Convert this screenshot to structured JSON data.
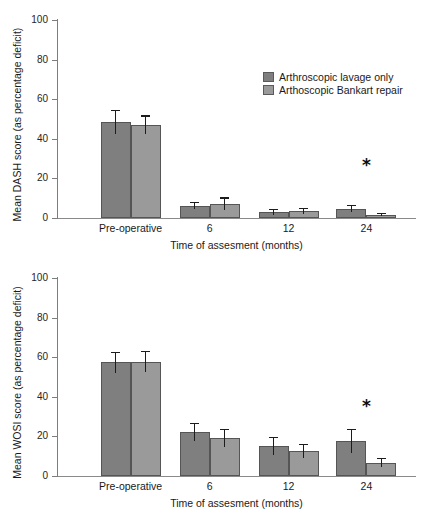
{
  "figure": {
    "panels": [
      "dash",
      "wosi"
    ]
  },
  "legend": {
    "position": "top-right-of-upper-panel",
    "entries": [
      {
        "label": "Arthroscopic lavage only",
        "color": "#7f7f7f",
        "key": "lavage"
      },
      {
        "label": "Arthoscopic Bankart repair",
        "color": "#9a9a9a",
        "key": "bankart"
      }
    ]
  },
  "colors": {
    "series_dark": "#7f7f7f",
    "series_light": "#9a9a9a",
    "axis": "#7d7d7d",
    "error_bar": "#1c1c1c",
    "text": "#1a1a1a"
  },
  "chart_data": [
    {
      "id": "dash",
      "type": "bar",
      "title": "",
      "xlabel": "Time of assesment (months)",
      "ylabel": "Mean DASH score (as percentage deficit)",
      "ylim": [
        0,
        100
      ],
      "yticks": [
        0,
        20,
        40,
        60,
        80,
        100
      ],
      "ytick_labels": [
        "0",
        "20",
        "40",
        "60",
        "80",
        "100"
      ],
      "grid": false,
      "legend_position": "upper right",
      "categories": [
        "Pre-operative",
        "6",
        "12",
        "24"
      ],
      "series": [
        {
          "name": "Arthroscopic lavage only",
          "color": "#7f7f7f",
          "values": [
            48.5,
            6.2,
            3.0,
            4.8
          ],
          "errors": [
            6.0,
            1.8,
            1.5,
            1.8
          ]
        },
        {
          "name": "Arthoscopic Bankart repair",
          "color": "#9a9a9a",
          "values": [
            47.0,
            7.2,
            3.6,
            1.7
          ],
          "errors": [
            4.8,
            3.2,
            1.6,
            0.7
          ]
        }
      ],
      "annotations": [
        {
          "text": "*",
          "category": "24",
          "y": 22,
          "meaning": "significant-difference"
        }
      ]
    },
    {
      "id": "wosi",
      "type": "bar",
      "title": "",
      "xlabel": "Time of assesment (months)",
      "ylabel": "Mean WOSI score (as percentage deficit)",
      "ylim": [
        0,
        100
      ],
      "yticks": [
        0,
        20,
        40,
        60,
        80,
        100
      ],
      "ytick_labels": [
        "0",
        "20",
        "40",
        "60",
        "80",
        "100"
      ],
      "grid": false,
      "legend_position": "none",
      "categories": [
        "Pre-operative",
        "6",
        "12",
        "24"
      ],
      "series": [
        {
          "name": "Arthroscopic lavage only",
          "color": "#7f7f7f",
          "values": [
            57.5,
            22.3,
            15.0,
            17.7
          ],
          "errors": [
            5.3,
            4.6,
            4.6,
            6.2
          ]
        },
        {
          "name": "Arthoscopic Bankart repair",
          "color": "#9a9a9a",
          "values": [
            57.8,
            19.3,
            12.7,
            6.7
          ],
          "errors": [
            5.3,
            4.4,
            3.4,
            2.3
          ]
        }
      ],
      "annotations": [
        {
          "text": "*",
          "category": "24",
          "y": 31,
          "meaning": "significant-difference"
        }
      ]
    }
  ]
}
